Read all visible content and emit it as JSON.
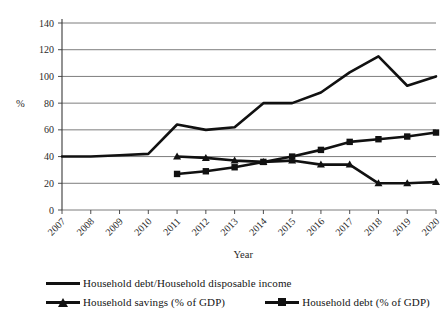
{
  "chart_data": {
    "type": "line",
    "title": "",
    "xlabel": "Year",
    "ylabel": "%",
    "ylim": [
      0,
      140
    ],
    "ytick_step": 20,
    "grid": true,
    "legend_position": "bottom",
    "categories": [
      "2007",
      "2008",
      "2009",
      "2010",
      "2011",
      "2012",
      "2013",
      "2014",
      "2015",
      "2016",
      "2017",
      "2018",
      "2019",
      "2020"
    ],
    "yticks": [
      "0",
      "20",
      "40",
      "60",
      "80",
      "100",
      "120",
      "140"
    ],
    "series": [
      {
        "name": "Household debt/Household disposable income",
        "marker": "none",
        "color": "#111111",
        "x": [
          "2007",
          "2008",
          "2009",
          "2010",
          "2011",
          "2012",
          "2013",
          "2014",
          "2015",
          "2016",
          "2017",
          "2018",
          "2019",
          "2020"
        ],
        "values": [
          40,
          40,
          41,
          42,
          64,
          60,
          62,
          80,
          80,
          88,
          103,
          115,
          93,
          100
        ]
      },
      {
        "name": "Household savings (% of GDP)",
        "marker": "triangle",
        "color": "#111111",
        "x": [
          "2011",
          "2012",
          "2013",
          "2014",
          "2015",
          "2016",
          "2017",
          "2018",
          "2019",
          "2020"
        ],
        "values": [
          40,
          39,
          37,
          36,
          37,
          34,
          34,
          20,
          20,
          21
        ]
      },
      {
        "name": "Household debt (% of GDP)",
        "marker": "square",
        "color": "#111111",
        "x": [
          "2011",
          "2012",
          "2013",
          "2014",
          "2015",
          "2016",
          "2017",
          "2018",
          "2019",
          "2020"
        ],
        "values": [
          27,
          29,
          32,
          36,
          40,
          45,
          51,
          53,
          55,
          58
        ]
      }
    ]
  },
  "legend": {
    "items": [
      {
        "label": "Household debt/Household disposable income",
        "marker": "line"
      },
      {
        "label": "Household savings (% of GDP)",
        "marker": "triangle"
      },
      {
        "label": "Household debt (% of GDP)",
        "marker": "square"
      }
    ]
  }
}
